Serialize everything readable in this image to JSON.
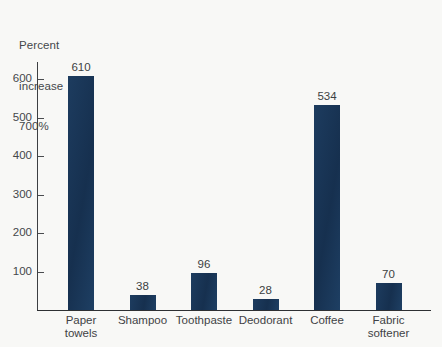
{
  "chart_data": {
    "type": "bar",
    "title": "",
    "axis_title_lines": [
      "Percent",
      "increase",
      "700%"
    ],
    "ylabel": "Percent increase 700%",
    "xlabel": "",
    "categories": [
      "Paper towels",
      "Shampoo",
      "Toothpaste",
      "Deodorant",
      "Coffee",
      "Fabric softener"
    ],
    "values": [
      610,
      38,
      96,
      28,
      534,
      70
    ],
    "value_labels": [
      "610",
      "38",
      "96",
      "28",
      "534",
      "70"
    ],
    "ytick_labels": [
      "100",
      "200",
      "300",
      "400",
      "500",
      "600"
    ],
    "yticks": [
      100,
      200,
      300,
      400,
      500,
      600
    ],
    "ylim": [
      0,
      700
    ],
    "grid": false,
    "legend": false,
    "bar_color": "#1b3a5c",
    "background_color": "#f8f8f6",
    "axis_color": "#2e3033",
    "text_color": "#3f4245"
  },
  "category_label_lines": [
    [
      "Paper",
      "towels"
    ],
    [
      "Shampoo"
    ],
    [
      "Toothpaste"
    ],
    [
      "Deodorant"
    ],
    [
      "Coffee"
    ],
    [
      "Fabric",
      "softener"
    ]
  ]
}
